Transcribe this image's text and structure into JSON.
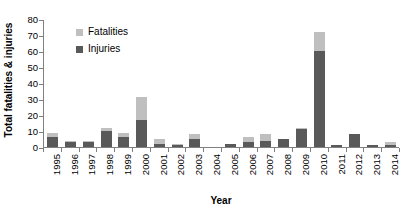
{
  "chart_data": {
    "type": "bar",
    "subtype": "stacked-bar",
    "title": "",
    "xlabel": "Year",
    "ylabel": "Total fatalities & injuries",
    "ylim": [
      0,
      80
    ],
    "yticks": [
      0,
      10,
      20,
      30,
      40,
      50,
      60,
      70,
      80
    ],
    "ytick_labels": [
      "0",
      "10",
      "20",
      "30",
      "40",
      "50",
      "60",
      "70",
      "80"
    ],
    "grid": false,
    "legend_position": "upper-left-inside",
    "categories": [
      "1995",
      "1996",
      "1997",
      "1998",
      "1999",
      "2000",
      "2001",
      "2002",
      "2003",
      "2004",
      "2005",
      "2006",
      "2007",
      "2008",
      "2009",
      "2010",
      "2011",
      "2012",
      "2013",
      "2014"
    ],
    "series": [
      {
        "name": "Injuries",
        "color": "#595959",
        "values": [
          6,
          3,
          3,
          10,
          6,
          17,
          2,
          1,
          5,
          0,
          2,
          3,
          4,
          5,
          11,
          60,
          1,
          8,
          1,
          1
        ]
      },
      {
        "name": "Fatalities",
        "color": "#bfbfbf",
        "values": [
          3,
          1,
          1,
          2,
          3,
          14,
          3,
          1,
          3,
          0,
          0,
          3,
          4,
          0,
          1,
          12,
          0,
          0,
          0,
          2
        ]
      }
    ],
    "totals": [
      9,
      4,
      4,
      12,
      9,
      31,
      5,
      2,
      8,
      0,
      2,
      6,
      8,
      5,
      12,
      72,
      1,
      8,
      1,
      3
    ]
  },
  "axes": {
    "y_title": "Total fatalities & injuries",
    "x_title": "Year"
  },
  "legend": {
    "entries": [
      {
        "label": "Fatalities",
        "color": "#bfbfbf"
      },
      {
        "label": "Injuries",
        "color": "#595959"
      }
    ]
  }
}
